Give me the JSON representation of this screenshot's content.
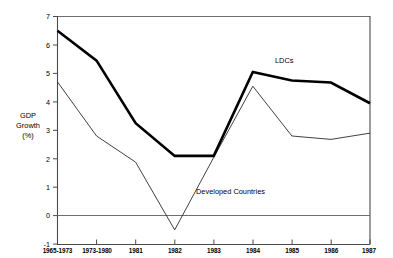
{
  "chart_data": {
    "type": "line",
    "title": "",
    "xlabel": "",
    "ylabel": "GDP\nGrowth\n(%)",
    "ylabel_lines": [
      "GDP",
      "Growth",
      "(%)"
    ],
    "categories": [
      "1965-1973",
      "1973-1980",
      "1981",
      "1982",
      "1983",
      "1984",
      "1985",
      "1986",
      "1987"
    ],
    "ylim": [
      -1,
      7
    ],
    "yticks": [
      -1,
      0,
      1,
      2,
      3,
      4,
      5,
      6,
      7
    ],
    "ytick_labels": [
      "-1",
      "0",
      "1",
      "2",
      "3",
      "4",
      "5",
      "6",
      "7"
    ],
    "grid": false,
    "legend_position": "inline-annotation",
    "series": [
      {
        "name": "LDCs",
        "style": "thick",
        "values": [
          6.5,
          5.45,
          3.25,
          2.1,
          2.1,
          5.05,
          4.75,
          4.68,
          3.95
        ]
      },
      {
        "name": "Developed Countries",
        "style": "thin",
        "values": [
          4.7,
          2.8,
          1.88,
          -0.5,
          2.05,
          4.55,
          2.8,
          2.68,
          2.9
        ]
      }
    ],
    "annotations": [
      {
        "text": "LDCs",
        "series": "LDCs",
        "x_px": 275,
        "y_px": 63
      },
      {
        "text": "Developed Countries",
        "series": "Developed Countries",
        "x_px": 196,
        "y_px": 194
      }
    ]
  }
}
